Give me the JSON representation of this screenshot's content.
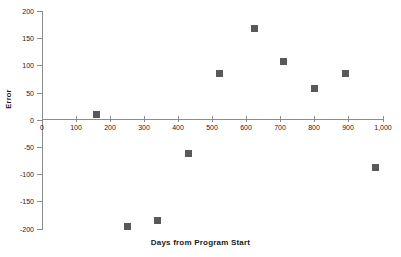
{
  "chart_data": {
    "type": "scatter",
    "title": "",
    "xlabel": "Days from Program Start",
    "ylabel": "Error",
    "xlim": [
      0,
      1000
    ],
    "ylim": [
      -200,
      200
    ],
    "xticks": [
      0,
      100,
      200,
      300,
      400,
      500,
      600,
      700,
      800,
      900,
      1000
    ],
    "xtick_labels": [
      "0",
      "100",
      "200",
      "300",
      "400",
      "500",
      "600",
      "700",
      "800",
      "900",
      "1,000"
    ],
    "yticks": [
      200,
      150,
      100,
      50,
      0,
      -50,
      -100,
      -150,
      -200
    ],
    "ytick_labels": [
      "200",
      "150",
      "100",
      "50",
      "0",
      "-50",
      "-100",
      "-150",
      "-200"
    ],
    "grid": false,
    "legend": false,
    "marker_color": "#595959",
    "marker_shape": "square",
    "axis_color": "#8c8c8c",
    "points": [
      {
        "x": 160,
        "y": 10
      },
      {
        "x": 250,
        "y": -197
      },
      {
        "x": 340,
        "y": -185
      },
      {
        "x": 430,
        "y": -62
      },
      {
        "x": 520,
        "y": 85
      },
      {
        "x": 625,
        "y": 168
      },
      {
        "x": 710,
        "y": 108
      },
      {
        "x": 800,
        "y": 58
      },
      {
        "x": 890,
        "y": 85
      },
      {
        "x": 980,
        "y": -88
      }
    ]
  }
}
